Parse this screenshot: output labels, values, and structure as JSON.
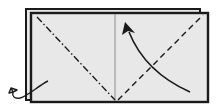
{
  "diagram": {
    "type": "origami-fold-instruction",
    "colors": {
      "paper": "#e8e8e8",
      "line": "#1a1a1a",
      "background": "#ffffff"
    },
    "elements": {
      "back_sheet": "back-paper-layer",
      "front_sheet": "front-paper-layer",
      "center_crease": "center-crease-line",
      "mountain_fold": "mountain-fold-line",
      "valley_fold": "valley-fold-line",
      "fold_arrow": "curved-fold-arrow",
      "fold_behind_arrow": "fold-behind-arrow"
    }
  }
}
